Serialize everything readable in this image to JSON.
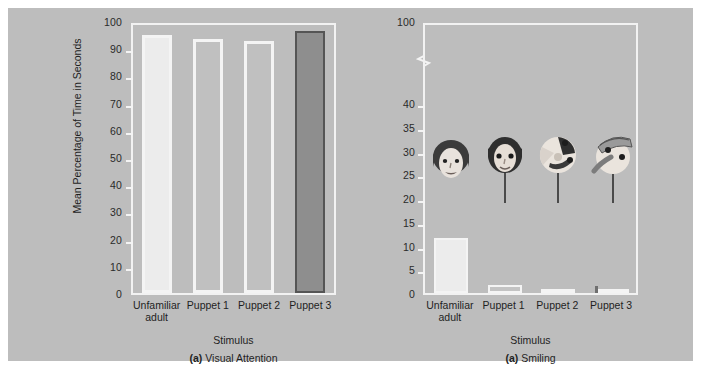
{
  "figure": {
    "background_color": "#bdbdbd",
    "page_color": "#ffffff"
  },
  "panel_a": {
    "caption_marker": "(a)",
    "caption_text": "Visual Attention",
    "axis_title_x": "Stimulus",
    "axis_title_y": "Mean Percentage of Time in Seconds"
  },
  "panel_b": {
    "caption_marker": "(a)",
    "caption_text": "Smiling",
    "axis_title_x": "Stimulus",
    "axis_title_y": ""
  },
  "categories": [
    "Unfamiliar adult",
    "Puppet 1",
    "Puppet 2",
    "Puppet 3"
  ],
  "category_lines": [
    [
      "Unfamiliar",
      "adult"
    ],
    [
      "Puppet 1"
    ],
    [
      "Puppet 2"
    ],
    [
      "Puppet 3"
    ]
  ],
  "art_labels": [
    "girl-face-photo",
    "puppet-1-face",
    "puppet-2-face",
    "puppet-3-face"
  ],
  "colors": {
    "background": "#bdbdbd",
    "frame": "#f2f2f2",
    "bar_light": "#ececec",
    "bar_outline_light": "#f4f4f4",
    "bar_dark": "#8e8e8e",
    "bar_outline_dark": "#555555",
    "text": "#1f1f1f"
  },
  "chart_data": [
    {
      "type": "bar",
      "title": "(a) Visual Attention",
      "xlabel": "Stimulus",
      "ylabel": "Mean Percentage of Time in Seconds",
      "categories": [
        "Unfamiliar adult",
        "Puppet 1",
        "Puppet 2",
        "Puppet 3"
      ],
      "values": [
        95,
        93.5,
        92.5,
        96.5
      ],
      "ylim": [
        0,
        100
      ],
      "yticks": [
        0,
        10,
        20,
        30,
        40,
        50,
        60,
        70,
        80,
        90,
        100
      ],
      "ytick_labels": [
        "0",
        "10",
        "20",
        "30",
        "40",
        "50",
        "60",
        "70",
        "80",
        "90",
        "100"
      ],
      "grid": false,
      "legend": null,
      "axis_break": false,
      "bar_styles": [
        "light",
        "light",
        "light",
        "dark"
      ]
    },
    {
      "type": "bar",
      "title": "(a) Smiling",
      "xlabel": "Stimulus",
      "ylabel": "",
      "categories": [
        "Unfamiliar adult",
        "Puppet 1",
        "Puppet 2",
        "Puppet 3"
      ],
      "values": [
        11.5,
        1.7,
        0.4,
        0.7
      ],
      "ylim": [
        0,
        100
      ],
      "yticks": [
        0,
        5,
        10,
        15,
        20,
        25,
        30,
        35,
        40,
        100
      ],
      "ytick_labels": [
        "0",
        "5",
        "10",
        "15",
        "20",
        "25",
        "30",
        "35",
        "40",
        "100"
      ],
      "grid": false,
      "legend": null,
      "axis_break": true,
      "axis_break_between": [
        40,
        100
      ],
      "bar_styles": [
        "light",
        "light",
        "light",
        "light"
      ]
    }
  ]
}
